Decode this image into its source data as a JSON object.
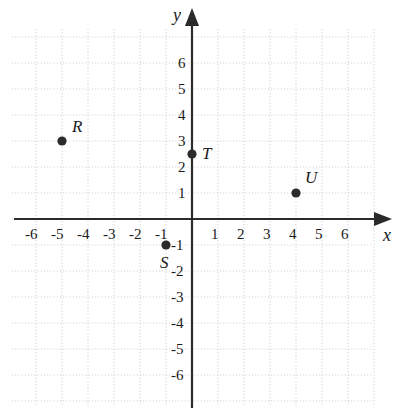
{
  "chart_data": {
    "type": "scatter",
    "title": "",
    "xlabel": "x",
    "ylabel": "y",
    "xlim": [
      -7,
      7
    ],
    "ylim": [
      -7,
      7
    ],
    "grid": true,
    "grid_color": "#c9c9c9",
    "axis_color": "#2b2b2b",
    "point_color": "#2b2b2b",
    "legend": "none",
    "x_ticks": [
      "-6",
      "-5",
      "-4",
      "-3",
      "-2",
      "-1",
      "1",
      "2",
      "3",
      "4",
      "5",
      "6"
    ],
    "x_tick_values": [
      -6,
      -5,
      -4,
      -3,
      -2,
      -1,
      1,
      2,
      3,
      4,
      5,
      6
    ],
    "y_ticks": [
      "6",
      "5",
      "4",
      "3",
      "2",
      "1",
      "-1",
      "-2",
      "-3",
      "-4",
      "-5",
      "-6"
    ],
    "y_tick_values": [
      6,
      5,
      4,
      3,
      2,
      1,
      -1,
      -2,
      -3,
      -4,
      -5,
      -6
    ],
    "points": [
      {
        "label": "R",
        "x": -5,
        "y": 3,
        "label_dx": 10,
        "label_dy": -14
      },
      {
        "label": "T",
        "x": 0,
        "y": 2.5,
        "label_dx": 10,
        "label_dy": 0
      },
      {
        "label": "U",
        "x": 4,
        "y": 1,
        "label_dx": 9,
        "label_dy": -15
      },
      {
        "label": "S",
        "x": -1,
        "y": -1,
        "label_dx": -6,
        "label_dy": 18
      }
    ]
  },
  "axes": {
    "x_axis_name": "x",
    "y_axis_name": "y"
  }
}
